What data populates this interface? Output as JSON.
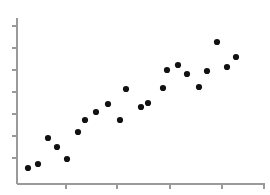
{
  "figure": {
    "background_color": "#ffffff",
    "axis_color": "#9a9a9a",
    "point_color": "#111111",
    "width": 270,
    "height": 195
  },
  "axes": {
    "y_axis": {
      "name": "y-axis",
      "x_pixel": 17,
      "y_top_pixel": 18,
      "y_bottom_pixel": 184,
      "tick_count": 7,
      "tick_length": 5,
      "tick_pixels": [
        26,
        48,
        70,
        92,
        114,
        136,
        158
      ],
      "tick_labels": [],
      "label": ""
    },
    "x_axis": {
      "name": "x-axis",
      "y_pixel": 184,
      "x_left_pixel": 17,
      "x_right_pixel": 265,
      "tick_count": 5,
      "tick_length": 5,
      "tick_pixels": [
        66,
        117,
        170,
        222,
        264
      ],
      "tick_labels": [],
      "label": ""
    }
  },
  "chart_data": {
    "type": "scatter",
    "title": "",
    "subtitle": "",
    "xlabel": "",
    "ylabel": "",
    "grid": false,
    "legend": null,
    "legend_position": "none",
    "marker": {
      "shape": "circle",
      "radius_px": 3.1,
      "color": "#111111"
    },
    "xlim": [
      0,
      10
    ],
    "ylim": [
      0,
      10
    ],
    "axis_tick_labels_shown": false,
    "n_points": 22,
    "points_pixel": [
      [
        28,
        168
      ],
      [
        38,
        164
      ],
      [
        48,
        138
      ],
      [
        57,
        147
      ],
      [
        67,
        159
      ],
      [
        78,
        132
      ],
      [
        85,
        120
      ],
      [
        96,
        112
      ],
      [
        108,
        104
      ],
      [
        120,
        120
      ],
      [
        126,
        89
      ],
      [
        141,
        107
      ],
      [
        148,
        103
      ],
      [
        163,
        88
      ],
      [
        167,
        70
      ],
      [
        178,
        65
      ],
      [
        187,
        74
      ],
      [
        199,
        87
      ],
      [
        207,
        71
      ],
      [
        217,
        42
      ],
      [
        227,
        67
      ],
      [
        236,
        57
      ]
    ],
    "x": [
      0.44,
      0.85,
      1.25,
      1.61,
      2.02,
      2.46,
      2.74,
      3.19,
      3.67,
      4.15,
      4.4,
      5.0,
      5.28,
      5.89,
      6.05,
      6.49,
      6.85,
      7.34,
      7.66,
      8.06,
      8.47,
      8.83
    ],
    "y": [
      0.96,
      1.2,
      2.77,
      2.23,
      1.51,
      3.13,
      3.86,
      4.34,
      4.82,
      3.86,
      5.73,
      4.64,
      4.88,
      5.78,
      6.87,
      7.17,
      6.63,
      5.84,
      6.81,
      8.55,
      7.05,
      7.65
    ]
  }
}
